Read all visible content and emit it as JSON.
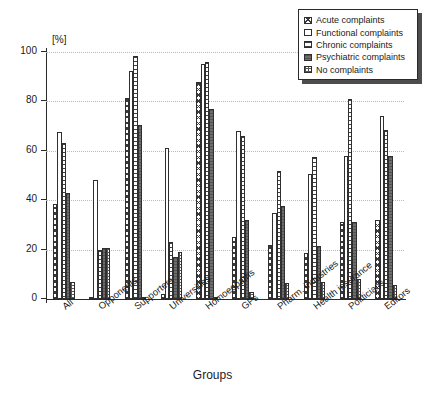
{
  "chart_data": {
    "type": "bar",
    "title": "",
    "xlabel": "Groups",
    "ylabel": "[%]",
    "ylim": [
      0,
      100
    ],
    "yticks": [
      0,
      20,
      40,
      60,
      80,
      100
    ],
    "grid": true,
    "legend_position": "top-right",
    "categories": [
      "All",
      "Opponents",
      "Supporters",
      "Universities",
      "Homoeopaths",
      "GPs",
      "Pharm. industries",
      "Health insurance",
      "Politicians",
      "Editors"
    ],
    "series": [
      {
        "name": "Acute complaints",
        "pattern": "cross-hatch",
        "values": [
          38.5,
          0.5,
          81.5,
          2.0,
          88.0,
          25.0,
          22.0,
          18.5,
          31.0,
          32.0
        ]
      },
      {
        "name": "Functional complaints",
        "pattern": "white",
        "values": [
          67.5,
          48.0,
          92.5,
          61.0,
          95.0,
          68.0,
          35.0,
          50.5,
          58.0,
          74.0
        ]
      },
      {
        "name": "Chronic complaints",
        "pattern": "horizontal-lines",
        "values": [
          63.0,
          20.0,
          98.5,
          23.0,
          96.0,
          66.0,
          52.0,
          57.5,
          81.0,
          68.5
        ]
      },
      {
        "name": "Psychiatric complaints",
        "pattern": "solid-dark",
        "values": [
          43.0,
          20.5,
          70.5,
          17.0,
          77.0,
          32.0,
          37.5,
          21.5,
          31.0,
          58.0
        ]
      },
      {
        "name": "No complaints",
        "pattern": "checkered",
        "values": [
          7.0,
          20.5,
          0.8,
          19.0,
          0.5,
          3.0,
          6.5,
          7.0,
          8.0,
          5.5
        ]
      }
    ]
  },
  "axis": {
    "y_unit_label": "[%]",
    "x_title": "Groups"
  }
}
